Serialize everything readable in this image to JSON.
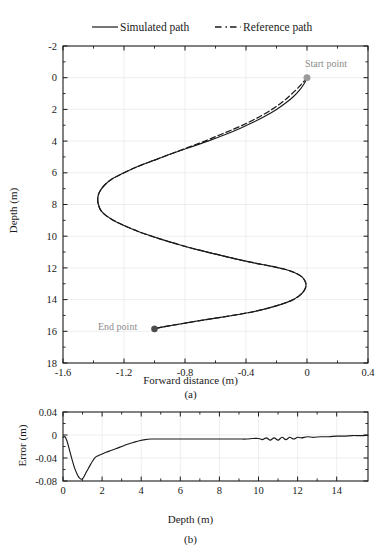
{
  "figure": {
    "background": "#ffffff",
    "axis_color": "#1a1a1a",
    "grid_color": "#e6e6e6",
    "curve_color": "#1a1a1a",
    "start_marker_color": "#9a9a9a",
    "end_marker_color": "#4d4d4d",
    "annotation_color": "#8c8c8c"
  },
  "legend": {
    "items": [
      {
        "label": "Simulated path",
        "style": "solid"
      },
      {
        "label": "Reference path",
        "style": "dashed"
      }
    ]
  },
  "panel_a": {
    "label": "(a)",
    "annotations": [
      {
        "name": "start-point",
        "text": "Start point",
        "x": 0.0,
        "y": 0.0
      },
      {
        "name": "end-point",
        "text": "End point",
        "x": -1.0,
        "y": 15.85
      }
    ]
  },
  "panel_b": {
    "label": "(b)"
  },
  "chart_data": [
    {
      "type": "line",
      "name": "panel-a-path-tracking",
      "title": "",
      "xlabel": "Forward distance (m)",
      "ylabel": "Depth (m)",
      "xlim": [
        -1.6,
        0.4
      ],
      "ylim": [
        -2,
        18
      ],
      "y_inverted": true,
      "xticks": [
        -1.6,
        -1.2,
        -0.8,
        -0.4,
        0,
        0.4
      ],
      "xticklabels": [
        "-1.6",
        "-1.2",
        "-0.8",
        "-0.4",
        "0",
        "0.4"
      ],
      "yticks": [
        -2,
        0,
        2,
        4,
        6,
        8,
        10,
        12,
        14,
        16,
        18
      ],
      "yticklabels": [
        "-2",
        "0",
        "2",
        "4",
        "6",
        "8",
        "10",
        "12",
        "14",
        "16",
        "18"
      ],
      "grid": true,
      "minor_ticks": true,
      "legend_position": "above-axes",
      "series": [
        {
          "name": "Simulated path",
          "style": "solid",
          "x": [
            0.0,
            -0.02,
            -0.05,
            -0.09,
            -0.14,
            -0.2,
            -0.27,
            -0.35,
            -0.44,
            -0.54,
            -0.65,
            -0.77,
            -0.89,
            -1.0,
            -1.11,
            -1.2,
            -1.28,
            -1.33,
            -1.36,
            -1.372,
            -1.368,
            -1.35,
            -1.31,
            -1.25,
            -1.17,
            -1.08,
            -0.97,
            -0.85,
            -0.72,
            -0.59,
            -0.46,
            -0.34,
            -0.23,
            -0.14,
            -0.08,
            -0.035,
            -0.012,
            -0.007,
            -0.02,
            -0.05,
            -0.1,
            -0.17,
            -0.26,
            -0.37,
            -0.49,
            -0.62,
            -0.75,
            -0.87,
            -0.96,
            -1.0
          ],
          "y": [
            0.0,
            0.4,
            0.8,
            1.2,
            1.6,
            2.0,
            2.4,
            2.8,
            3.2,
            3.6,
            4.0,
            4.4,
            4.8,
            5.2,
            5.6,
            6.0,
            6.4,
            6.8,
            7.2,
            7.6,
            8.0,
            8.4,
            8.75,
            9.1,
            9.45,
            9.8,
            10.15,
            10.5,
            10.85,
            11.15,
            11.45,
            11.7,
            11.9,
            12.1,
            12.3,
            12.55,
            12.85,
            13.15,
            13.45,
            13.75,
            14.05,
            14.3,
            14.55,
            14.8,
            15.0,
            15.2,
            15.4,
            15.6,
            15.75,
            15.85
          ]
        },
        {
          "name": "Reference path",
          "style": "dashed",
          "x": [
            0.0,
            -0.035,
            -0.075,
            -0.12,
            -0.17,
            -0.23,
            -0.3,
            -0.38,
            -0.47,
            -0.57,
            -0.67,
            -0.78,
            -0.89,
            -1.0,
            -1.11,
            -1.2,
            -1.28,
            -1.33,
            -1.36,
            -1.372,
            -1.368,
            -1.35,
            -1.31,
            -1.25,
            -1.17,
            -1.08,
            -0.97,
            -0.85,
            -0.72,
            -0.59,
            -0.46,
            -0.34,
            -0.23,
            -0.14,
            -0.08,
            -0.035,
            -0.012,
            -0.007,
            -0.02,
            -0.05,
            -0.1,
            -0.17,
            -0.26,
            -0.37,
            -0.49,
            -0.62,
            -0.75,
            -0.87,
            -0.96,
            -1.0
          ],
          "y": [
            0.0,
            0.4,
            0.8,
            1.2,
            1.6,
            2.0,
            2.4,
            2.8,
            3.2,
            3.6,
            4.0,
            4.4,
            4.8,
            5.2,
            5.6,
            6.0,
            6.4,
            6.8,
            7.2,
            7.6,
            8.0,
            8.4,
            8.75,
            9.1,
            9.45,
            9.8,
            10.15,
            10.5,
            10.85,
            11.15,
            11.45,
            11.7,
            11.9,
            12.1,
            12.3,
            12.55,
            12.85,
            13.15,
            13.45,
            13.75,
            14.05,
            14.3,
            14.55,
            14.8,
            15.0,
            15.2,
            15.4,
            15.6,
            15.75,
            15.85
          ]
        }
      ]
    },
    {
      "type": "line",
      "name": "panel-b-tracking-error",
      "title": "",
      "xlabel": "Depth (m)",
      "ylabel": "Error (m)",
      "xlim": [
        0,
        15.6
      ],
      "ylim": [
        -0.08,
        0.04
      ],
      "xticks": [
        0,
        2,
        4,
        6,
        8,
        10,
        12,
        14
      ],
      "xticklabels": [
        "0",
        "2",
        "4",
        "6",
        "8",
        "10",
        "12",
        "14"
      ],
      "yticks": [
        -0.08,
        -0.04,
        0,
        0.04
      ],
      "yticklabels": [
        "-0.08",
        "-0.04",
        "0",
        "0.04"
      ],
      "grid": true,
      "minor_ticks": true,
      "series": [
        {
          "name": "Error",
          "style": "solid",
          "x": [
            0.0,
            0.1,
            0.2,
            0.3,
            0.45,
            0.6,
            0.75,
            0.85,
            0.95,
            1.05,
            1.2,
            1.35,
            1.5,
            1.65,
            1.8,
            2.0,
            2.2,
            2.45,
            2.7,
            3.0,
            3.3,
            3.6,
            3.9,
            4.2,
            4.5,
            4.8,
            5.2,
            5.6,
            6.0,
            6.5,
            7.0,
            7.5,
            8.0,
            8.5,
            9.0,
            9.4,
            9.7,
            10.0,
            10.2,
            10.4,
            10.6,
            10.8,
            11.0,
            11.2,
            11.4,
            11.6,
            11.8,
            12.0,
            12.2,
            12.5,
            12.8,
            13.2,
            13.6,
            14.0,
            14.4,
            14.8,
            15.2,
            15.6
          ],
          "y": [
            -0.004,
            -0.003,
            -0.01,
            -0.022,
            -0.041,
            -0.058,
            -0.07,
            -0.075,
            -0.077,
            -0.074,
            -0.064,
            -0.055,
            -0.046,
            -0.039,
            -0.036,
            -0.033,
            -0.03,
            -0.027,
            -0.024,
            -0.02,
            -0.016,
            -0.013,
            -0.01,
            -0.008,
            -0.007,
            -0.007,
            -0.007,
            -0.007,
            -0.007,
            -0.007,
            -0.007,
            -0.007,
            -0.007,
            -0.007,
            -0.007,
            -0.007,
            -0.006,
            -0.006,
            -0.008,
            -0.005,
            -0.009,
            -0.005,
            -0.009,
            -0.004,
            -0.008,
            -0.004,
            -0.007,
            -0.004,
            -0.005,
            -0.003,
            -0.004,
            -0.003,
            -0.003,
            -0.002,
            -0.002,
            -0.001,
            -0.001,
            -0.0005
          ]
        }
      ]
    }
  ]
}
